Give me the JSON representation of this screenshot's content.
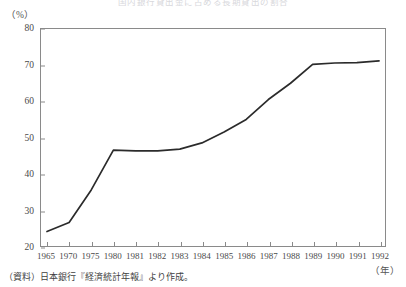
{
  "figure": {
    "title": "国内銀行貸出金に占める長期貸出の割合",
    "y_unit_label": "（%）",
    "x_unit_label": "（年）",
    "source_note": "（資料）日本銀行『経済統計年報』より作成。",
    "line_color": "#2b2b2b",
    "axis_color": "#8a8a8a"
  },
  "chart_data": {
    "type": "line",
    "title": "国内銀行貸出金に占める長期貸出の割合",
    "xlabel": "（年）",
    "ylabel": "（%）",
    "ylim": [
      20,
      80
    ],
    "ytick_labels": [
      "20",
      "30",
      "40",
      "50",
      "60",
      "70",
      "80"
    ],
    "ytick_values": [
      20,
      30,
      40,
      50,
      60,
      70,
      80
    ],
    "grid": false,
    "legend": "none",
    "categories": [
      "1965",
      "1970",
      "1975",
      "1980",
      "1981",
      "1982",
      "1983",
      "1984",
      "1985",
      "1986",
      "1987",
      "1988",
      "1989",
      "1990",
      "1991",
      "1992"
    ],
    "x": [
      1965,
      1970,
      1975,
      1980,
      1981,
      1982,
      1983,
      1984,
      1985,
      1986,
      1987,
      1988,
      1989,
      1990,
      1991,
      1992
    ],
    "values": [
      24.0,
      26.5,
      35.5,
      46.5,
      46.3,
      46.3,
      46.8,
      48.5,
      51.5,
      55.0,
      60.5,
      65.0,
      70.2,
      70.6,
      70.7,
      71.2
    ],
    "series": [
      {
        "name": "長期貸出割合",
        "values": [
          24.0,
          26.5,
          35.5,
          46.5,
          46.3,
          46.3,
          46.8,
          48.5,
          51.5,
          55.0,
          60.5,
          65.0,
          70.2,
          70.6,
          70.7,
          71.2
        ]
      }
    ]
  }
}
